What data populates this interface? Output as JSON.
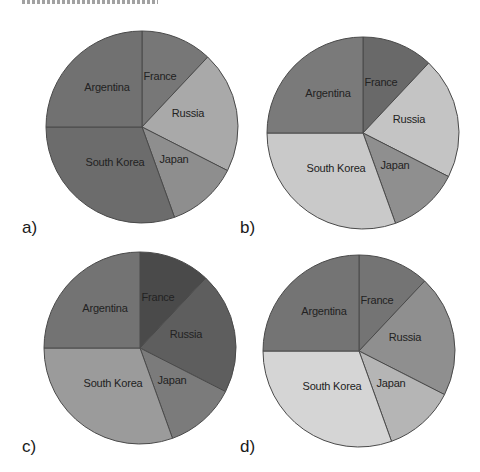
{
  "chart_data": [
    {
      "type": "pie",
      "panel": "a)",
      "title": "",
      "start_angle_deg": 0,
      "direction": "clockwise",
      "categories": [
        "France",
        "Russia",
        "Japan",
        "South Korea",
        "Argentina"
      ],
      "values": [
        12,
        20.5,
        12,
        30.5,
        25
      ],
      "colors": [
        "#777777",
        "#a9a9a9",
        "#8e8e8e",
        "#6c6c6c",
        "#717171"
      ]
    },
    {
      "type": "pie",
      "panel": "b)",
      "title": "",
      "start_angle_deg": 0,
      "direction": "clockwise",
      "categories": [
        "France",
        "Russia",
        "Japan",
        "South Korea",
        "Argentina"
      ],
      "values": [
        12,
        20.5,
        12,
        30.5,
        25
      ],
      "colors": [
        "#696969",
        "#c4c4c4",
        "#8f8f8f",
        "#c9c9c9",
        "#7a7a7a"
      ]
    },
    {
      "type": "pie",
      "panel": "c)",
      "title": "",
      "start_angle_deg": 0,
      "direction": "clockwise",
      "categories": [
        "France",
        "Russia",
        "Japan",
        "South Korea",
        "Argentina"
      ],
      "values": [
        12,
        20.5,
        12,
        30.5,
        25
      ],
      "colors": [
        "#4a4a4a",
        "#5e5e5e",
        "#7b7b7b",
        "#9b9b9b",
        "#737373"
      ]
    },
    {
      "type": "pie",
      "panel": "d)",
      "title": "",
      "start_angle_deg": 0,
      "direction": "clockwise",
      "categories": [
        "France",
        "Russia",
        "Japan",
        "South Korea",
        "Argentina"
      ],
      "values": [
        12,
        20.5,
        12,
        30.5,
        25
      ],
      "colors": [
        "#747474",
        "#8f8f8f",
        "#b5b5b5",
        "#d5d5d5",
        "#747474"
      ]
    }
  ],
  "panels": [
    {
      "letter": "a)",
      "labels": [
        "France",
        "Russia",
        "Japan",
        "South Korea",
        "Argentina"
      ]
    },
    {
      "letter": "b)",
      "labels": [
        "France",
        "Russia",
        "Japan",
        "South Korea",
        "Argentina"
      ]
    },
    {
      "letter": "c)",
      "labels": [
        "France",
        "Russia",
        "Japan",
        "South Korea",
        "Argentina"
      ]
    },
    {
      "letter": "d)",
      "labels": [
        "France",
        "Russia",
        "Japan",
        "South Korea",
        "Argentina"
      ]
    }
  ],
  "style": {
    "outline_color": "#4a4a4a",
    "background": "#ffffff"
  }
}
